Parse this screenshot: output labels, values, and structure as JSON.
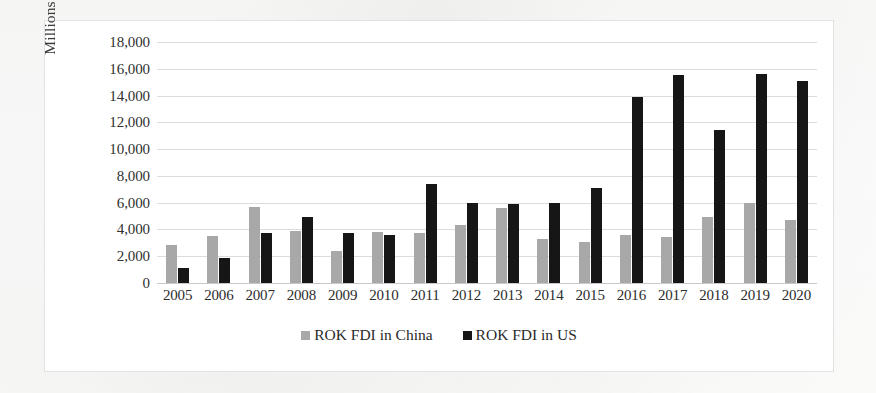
{
  "chart_data": {
    "type": "bar",
    "title": "",
    "xlabel": "",
    "ylabel": "Millions of dollars",
    "categories": [
      "2005",
      "2006",
      "2007",
      "2008",
      "2009",
      "2010",
      "2011",
      "2012",
      "2013",
      "2014",
      "2015",
      "2016",
      "2017",
      "2018",
      "2019",
      "2020"
    ],
    "series": [
      {
        "name": "ROK FDI in China",
        "color": "#a8a8a8",
        "values": [
          2850,
          3500,
          5700,
          3900,
          2400,
          3800,
          3700,
          4300,
          5600,
          3300,
          3100,
          3600,
          3400,
          4900,
          6000,
          4700
        ]
      },
      {
        "name": "ROK FDI in US",
        "color": "#161616",
        "values": [
          1150,
          1900,
          3700,
          4900,
          3700,
          3600,
          7400,
          6000,
          5900,
          6000,
          7100,
          13900,
          15500,
          11400,
          15600,
          15100
        ]
      }
    ],
    "ylim": [
      0,
      18000
    ],
    "ytick_values": [
      0,
      2000,
      4000,
      6000,
      8000,
      10000,
      12000,
      14000,
      16000,
      18000
    ],
    "ytick_labels": [
      "0",
      "2,000",
      "4,000",
      "6,000",
      "8,000",
      "10,000",
      "12,000",
      "14,000",
      "16,000",
      "18,000"
    ],
    "grid": true,
    "legend_position": "bottom"
  }
}
